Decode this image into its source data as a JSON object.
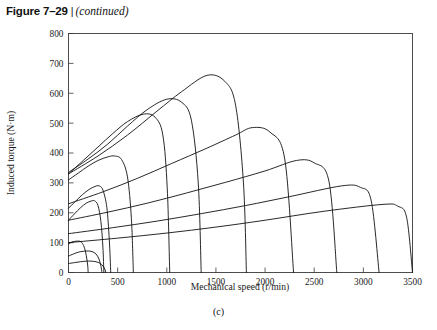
{
  "figure": {
    "number": "Figure 7–29",
    "separator": "|",
    "continued": "(continued)",
    "subcaption": "(c)"
  },
  "chart_data": {
    "type": "line",
    "title": "",
    "xlabel": "Mechanical speed (r/min)",
    "ylabel": "Induced torque (N·m)",
    "xlim": [
      0,
      3500
    ],
    "ylim": [
      0,
      800
    ],
    "xticks": [
      0,
      500,
      1000,
      1500,
      2000,
      2500,
      3000,
      3500
    ],
    "yticks": [
      0,
      100,
      200,
      300,
      400,
      500,
      600,
      700,
      800
    ],
    "xticklabels": [
      "0",
      "500",
      "1000",
      "1500",
      "2000",
      "2500",
      "3000",
      "3500"
    ],
    "yticklabels": [
      "0",
      "100",
      "200",
      "300",
      "400",
      "500",
      "600",
      "700",
      "800"
    ],
    "grid": false,
    "legend": null,
    "legend_position": "none",
    "series": [
      {
        "name": "curve-1",
        "synchronous_speed": 200,
        "peak_speed": 110,
        "peak_torque": 105,
        "starting_torque": 95,
        "x": [
          0,
          30,
          60,
          90,
          110,
          135,
          160,
          180,
          195,
          200
        ],
        "y": [
          95,
          101,
          104,
          105,
          105,
          100,
          85,
          58,
          25,
          0
        ]
      },
      {
        "name": "curve-2",
        "synchronous_speed": 340,
        "peak_speed": 200,
        "peak_torque": 72,
        "starting_torque": 55,
        "x": [
          0,
          50,
          100,
          150,
          200,
          240,
          280,
          310,
          330,
          340
        ],
        "y": [
          55,
          62,
          68,
          71,
          72,
          70,
          62,
          45,
          22,
          0
        ]
      },
      {
        "name": "curve-3",
        "synchronous_speed": 380,
        "peak_speed": 230,
        "peak_torque": 38,
        "starting_torque": 30,
        "x": [
          0,
          60,
          120,
          180,
          230,
          280,
          320,
          350,
          370,
          380
        ],
        "y": [
          30,
          33,
          36,
          38,
          38,
          36,
          31,
          22,
          11,
          0
        ]
      },
      {
        "name": "curve-4",
        "synchronous_speed": 360,
        "peak_speed": 250,
        "peak_torque": 240,
        "starting_torque": 175,
        "x": [
          0,
          60,
          120,
          180,
          230,
          265,
          300,
          330,
          350,
          360
        ],
        "y": [
          175,
          196,
          216,
          232,
          239,
          240,
          224,
          170,
          85,
          0
        ]
      },
      {
        "name": "curve-5",
        "synchronous_speed": 430,
        "peak_speed": 300,
        "peak_torque": 290,
        "starting_torque": 215,
        "x": [
          0,
          70,
          140,
          210,
          270,
          310,
          350,
          390,
          415,
          430
        ],
        "y": [
          215,
          238,
          260,
          278,
          288,
          290,
          276,
          218,
          110,
          0
        ]
      },
      {
        "name": "curve-6",
        "synchronous_speed": 660,
        "peak_speed": 470,
        "peak_torque": 390,
        "starting_torque": 310,
        "x": [
          0,
          100,
          200,
          300,
          400,
          470,
          540,
          600,
          640,
          660
        ],
        "y": [
          310,
          333,
          356,
          375,
          387,
          390,
          378,
          320,
          180,
          0
        ]
      },
      {
        "name": "curve-7",
        "synchronous_speed": 1030,
        "peak_speed": 760,
        "peak_torque": 530,
        "starting_torque": 330,
        "x": [
          0,
          150,
          300,
          450,
          600,
          760,
          880,
          960,
          1005,
          1030
        ],
        "y": [
          330,
          375,
          420,
          465,
          505,
          530,
          520,
          460,
          280,
          0
        ]
      },
      {
        "name": "curve-8",
        "synchronous_speed": 1350,
        "peak_speed": 1000,
        "peak_torque": 580,
        "starting_torque": 335,
        "x": [
          0,
          200,
          400,
          600,
          800,
          1000,
          1150,
          1250,
          1320,
          1350
        ],
        "y": [
          335,
          380,
          430,
          490,
          545,
          580,
          570,
          510,
          300,
          0
        ]
      },
      {
        "name": "curve-9",
        "synchronous_speed": 1810,
        "peak_speed": 1410,
        "peak_torque": 660,
        "starting_torque": 330,
        "x": [
          0,
          300,
          600,
          900,
          1150,
          1410,
          1590,
          1700,
          1780,
          1810
        ],
        "y": [
          330,
          390,
          460,
          540,
          605,
          660,
          640,
          560,
          300,
          0
        ]
      },
      {
        "name": "curve-10",
        "synchronous_speed": 2290,
        "peak_speed": 1870,
        "peak_torque": 485,
        "starting_torque": 230,
        "x": [
          0,
          350,
          700,
          1050,
          1400,
          1700,
          1870,
          2050,
          2200,
          2290
        ],
        "y": [
          230,
          270,
          315,
          365,
          415,
          460,
          485,
          470,
          380,
          0
        ]
      },
      {
        "name": "curve-11",
        "synchronous_speed": 2730,
        "peak_speed": 2320,
        "peak_torque": 375,
        "starting_torque": 175,
        "x": [
          0,
          400,
          800,
          1200,
          1600,
          2000,
          2320,
          2500,
          2650,
          2730
        ],
        "y": [
          175,
          202,
          232,
          266,
          302,
          340,
          375,
          367,
          305,
          0
        ]
      },
      {
        "name": "curve-12",
        "synchronous_speed": 3160,
        "peak_speed": 2780,
        "peak_torque": 290,
        "starting_torque": 130,
        "x": [
          0,
          450,
          900,
          1350,
          1800,
          2250,
          2780,
          2970,
          3080,
          3160
        ],
        "y": [
          130,
          150,
          172,
          197,
          224,
          254,
          290,
          285,
          240,
          0
        ]
      },
      {
        "name": "curve-13",
        "synchronous_speed": 3500,
        "peak_speed": 3200,
        "peak_torque": 228,
        "starting_torque": 100,
        "x": [
          0,
          500,
          1000,
          1500,
          2000,
          2600,
          3200,
          3350,
          3440,
          3500
        ],
        "y": [
          100,
          115,
          132,
          152,
          175,
          205,
          228,
          222,
          185,
          0
        ]
      }
    ]
  }
}
